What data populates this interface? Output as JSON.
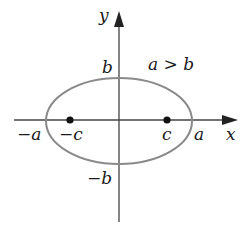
{
  "diagram": {
    "axes": {
      "x_label": "x",
      "y_label": "y"
    },
    "condition": "a > b",
    "vertex_labels": {
      "pos_a": "a",
      "neg_a": "−a",
      "pos_b": "b",
      "neg_b": "−b"
    },
    "focus_labels": {
      "pos_c": "c",
      "neg_c": "−c"
    },
    "colors": {
      "ellipse": "#8a8a8a",
      "axes": "#444444",
      "foci": "#111111",
      "text": "#1a1a1a"
    }
  }
}
